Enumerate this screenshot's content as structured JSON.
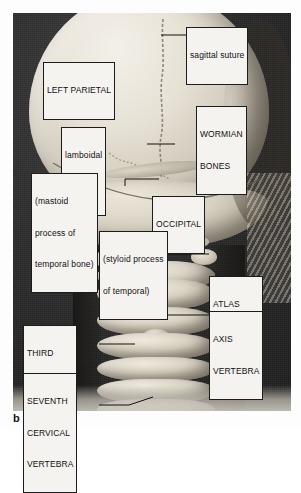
{
  "figure": {
    "caption_letter": "b",
    "plate_background_color": "#2b2b2b",
    "label_background_color": "#f4f3ef",
    "label_border_color": "#1c1c1c",
    "bone_color": "#ddd6c6"
  },
  "labels": [
    {
      "id": "sagittal-suture",
      "lines": [
        "sagittal suture"
      ],
      "case": "lower",
      "leader": "line-left"
    },
    {
      "id": "left-parietal",
      "lines": [
        "LEFT PARIETAL"
      ],
      "case": "upper",
      "leader": "none"
    },
    {
      "id": "wormian-bones",
      "lines": [
        "WORMIAN",
        "BONES"
      ],
      "case": "upper",
      "leader": "fork-down"
    },
    {
      "id": "lamboidal-suture",
      "lines": [
        "lamboidal",
        "suture"
      ],
      "case": "lower",
      "leader": "line-right"
    },
    {
      "id": "mastoid-process",
      "lines": [
        "(mastoid",
        "process of",
        "temporal bone)"
      ],
      "case": "lower",
      "leader": "line-up-right"
    },
    {
      "id": "occipital",
      "lines": [
        "OCCIPITAL"
      ],
      "case": "upper",
      "leader": "none"
    },
    {
      "id": "styloid-process",
      "lines": [
        "(styloid process",
        "of temporal)"
      ],
      "case": "lower",
      "leader": "line-left-down"
    },
    {
      "id": "atlas-vertebra",
      "lines": [
        "ATLAS",
        "VERTEBRA"
      ],
      "case": "upper",
      "leader": "line-left"
    },
    {
      "id": "axis-vertebra",
      "lines": [
        "AXIS",
        "VERTEBRA"
      ],
      "case": "upper",
      "leader": "line-left"
    },
    {
      "id": "third-cervical-vertebra",
      "lines": [
        "THIRD",
        "CERVICAL",
        "VERTEBRA"
      ],
      "case": "upper",
      "leader": "line-right"
    },
    {
      "id": "seventh-cervical-vertebra",
      "lines": [
        "SEVENTH",
        "CERVICAL",
        "VERTEBRA"
      ],
      "case": "upper",
      "leader": "line-right-down"
    }
  ]
}
